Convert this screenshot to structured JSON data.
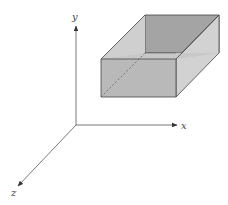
{
  "diagram": {
    "type": "3d-coordinate-box",
    "axes": {
      "x_label": "x",
      "y_label": "y",
      "z_label": "z"
    },
    "colors": {
      "axis": "#555555",
      "box_edge": "#444444",
      "front_face": "#b9b9b9",
      "top_face": "#cfcfcf",
      "right_face": "#d2d2d2",
      "back_face": "#a4a4a4",
      "hidden_edge": "#555555"
    }
  }
}
